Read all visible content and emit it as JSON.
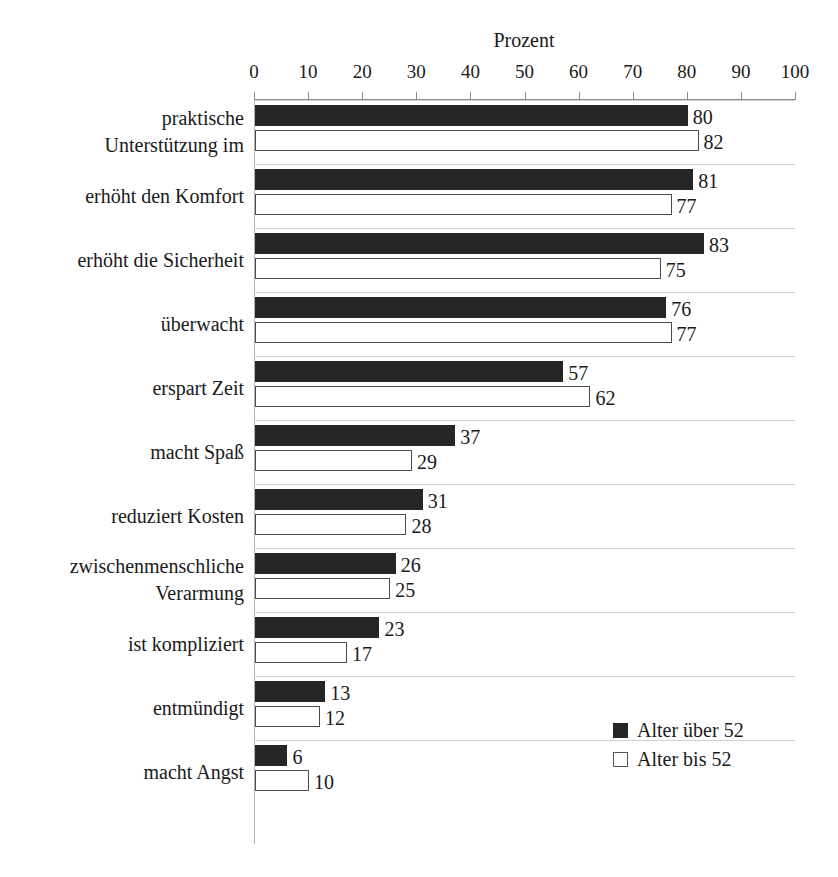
{
  "top_caption_fragment": "",
  "legend": {
    "position": "bottom-right",
    "items": [
      {
        "label": "Alter über 52",
        "swatch": "filled-square-icon",
        "color": "#262626"
      },
      {
        "label": "Alter bis 52",
        "swatch": "outlined-square-icon",
        "color": "#ffffff"
      }
    ]
  },
  "chart_data": {
    "type": "bar",
    "orientation": "horizontal",
    "title": "Prozent",
    "xlabel": "Prozent",
    "ylabel": "",
    "xlim": [
      0,
      100
    ],
    "xticks": [
      0,
      10,
      20,
      30,
      40,
      50,
      60,
      70,
      80,
      90,
      100
    ],
    "grid": false,
    "legend_position": "bottom-right",
    "categories": [
      "praktische Unterstützung im",
      "erhöht den Komfort",
      "erhöht die Sicherheit",
      "überwacht",
      "erspart Zeit",
      "macht Spaß",
      "reduziert Kosten",
      "zwischenmenschliche Verarmung",
      "ist kompliziert",
      "entmündigt",
      "macht Angst"
    ],
    "category_lines": [
      [
        "praktische",
        "Unterstützung im"
      ],
      [
        "erhöht den Komfort"
      ],
      [
        "erhöht die Sicherheit"
      ],
      [
        "überwacht"
      ],
      [
        "erspart Zeit"
      ],
      [
        "macht Spaß"
      ],
      [
        "reduziert Kosten"
      ],
      [
        "zwischenmenschliche",
        "Verarmung"
      ],
      [
        "ist kompliziert"
      ],
      [
        "entmündigt"
      ],
      [
        "macht Angst"
      ]
    ],
    "series": [
      {
        "name": "Alter über 52",
        "color": "#262626",
        "values": [
          80,
          81,
          83,
          76,
          57,
          37,
          31,
          26,
          23,
          13,
          6
        ]
      },
      {
        "name": "Alter bis 52",
        "color": "#ffffff",
        "values": [
          82,
          77,
          75,
          77,
          62,
          29,
          28,
          25,
          17,
          12,
          10
        ]
      }
    ]
  }
}
